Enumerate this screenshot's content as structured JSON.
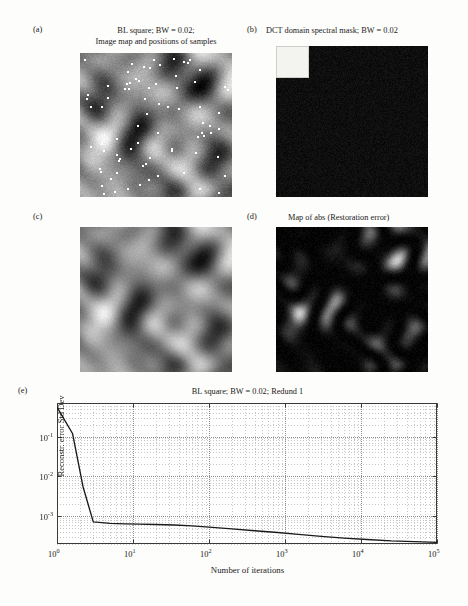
{
  "figure": {
    "panels": [
      {
        "letter": "(a)",
        "title_line1": "BL square; BW = 0.02;",
        "title_line2": "Image map and positions of samples",
        "kind": "grayscale-image-with-sample-dots"
      },
      {
        "letter": "(b)",
        "title_line1": "DCT domain spectral mask; BW = 0.02",
        "title_line2": "",
        "kind": "binary-mask-image"
      },
      {
        "letter": "(c)",
        "title_line1": "",
        "title_line2": "",
        "kind": "grayscale-image"
      },
      {
        "letter": "(d)",
        "title_line1": "Map of abs (Restoration error)",
        "title_line2": "",
        "kind": "grayscale-error-image"
      },
      {
        "letter": "(e)",
        "title_line1": "BL square; BW = 0.02; Redund 1",
        "title_line2": "",
        "kind": "log-log-plot"
      }
    ]
  },
  "chart_data": {
    "type": "line",
    "title": "BL square; BW = 0.02; Redund 1",
    "xlabel": "Number of iterations",
    "ylabel": "Reconstr. error Std Dev",
    "xscale": "log",
    "yscale": "log",
    "xlim": [
      1,
      100000
    ],
    "ylim": [
      0.0002,
      0.7
    ],
    "xticks": [
      1,
      10,
      100,
      1000,
      10000,
      100000
    ],
    "xticklabels": [
      "10<sup>0</sup>",
      "10<sup>1</sup>",
      "10<sup>2</sup>",
      "10<sup>3</sup>",
      "10<sup>4</sup>",
      "10<sup>5</sup>"
    ],
    "yticks": [
      0.1,
      0.01,
      0.001
    ],
    "yticklabels": [
      "10<sup>-1</sup>",
      "10<sup>-2</sup>",
      "10<sup>-3</sup>"
    ],
    "grid": true,
    "grid_minor": true,
    "legend": "none",
    "series": [
      {
        "name": "Reconstr. error Std Dev",
        "color": "#1a1a1a",
        "x": [
          1,
          1.6,
          2.2,
          3,
          5,
          8,
          12,
          20,
          35,
          60,
          100,
          200,
          400,
          800,
          1500,
          3000,
          6000,
          12000,
          25000,
          50000,
          100000
        ],
        "y": [
          0.55,
          0.12,
          0.0055,
          0.00072,
          0.00066,
          0.00064,
          0.00063,
          0.00062,
          0.0006,
          0.00057,
          0.00053,
          0.00048,
          0.00043,
          0.00039,
          0.00035,
          0.00031,
          0.00028,
          0.00026,
          0.00024,
          0.00023,
          0.00022
        ]
      }
    ]
  },
  "panel_a": {
    "letter": "(a)",
    "title_line1": "BL square; BW = 0.02;",
    "title_line2": "Image map and positions of samples"
  },
  "panel_b": {
    "letter": "(b)",
    "title": "DCT domain spectral mask; BW = 0.02"
  },
  "panel_c": {
    "letter": "(c)"
  },
  "panel_d": {
    "letter": "(d)",
    "title": "Map of abs (Restoration error)"
  },
  "panel_e": {
    "letter": "(e)",
    "title": "BL square; BW = 0.02; Redund 1",
    "xlabel": "Number of iterations",
    "ylabel": "Reconstr. error Std Dev"
  },
  "colors": {
    "background": "#fdfdfb",
    "ink": "#1a1a1a",
    "grid": "#b9b9b9",
    "curve": "#1a1a1a",
    "mask_on": "#f2f2ee",
    "mask_off": "#0b0b0b"
  }
}
